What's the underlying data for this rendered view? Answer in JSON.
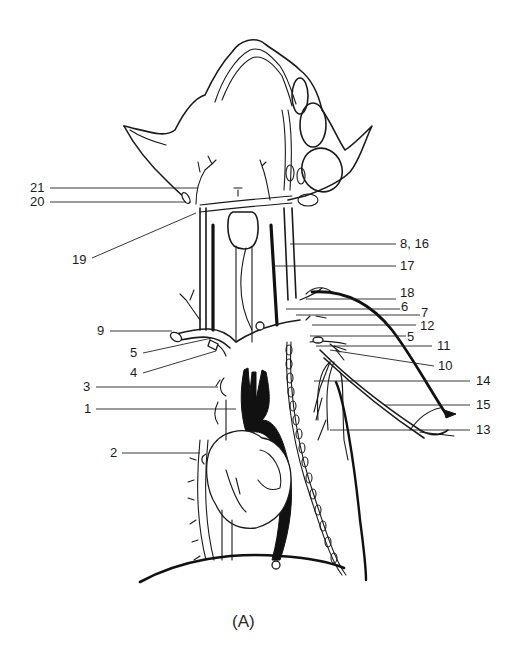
{
  "figure": {
    "caption": "(A)"
  },
  "labels": [
    {
      "id": "21",
      "text": "21",
      "side": "left"
    },
    {
      "id": "20",
      "text": "20",
      "side": "left"
    },
    {
      "id": "19",
      "text": "19",
      "side": "left"
    },
    {
      "id": "8_16",
      "text": "8, 16",
      "side": "right"
    },
    {
      "id": "17",
      "text": "17",
      "side": "right"
    },
    {
      "id": "18",
      "text": "18",
      "side": "right"
    },
    {
      "id": "6",
      "text": "6",
      "side": "right"
    },
    {
      "id": "7",
      "text": "7",
      "side": "right"
    },
    {
      "id": "12",
      "text": "12",
      "side": "right"
    },
    {
      "id": "5r",
      "text": "5",
      "side": "right"
    },
    {
      "id": "11",
      "text": "11",
      "side": "right"
    },
    {
      "id": "10",
      "text": "10",
      "side": "right"
    },
    {
      "id": "14",
      "text": "14",
      "side": "right"
    },
    {
      "id": "15",
      "text": "15",
      "side": "right"
    },
    {
      "id": "13",
      "text": "13",
      "side": "right"
    },
    {
      "id": "9",
      "text": "9",
      "side": "left"
    },
    {
      "id": "5l",
      "text": "5",
      "side": "left"
    },
    {
      "id": "4",
      "text": "4",
      "side": "left"
    },
    {
      "id": "3",
      "text": "3",
      "side": "left"
    },
    {
      "id": "1",
      "text": "1",
      "side": "left"
    },
    {
      "id": "2",
      "text": "2",
      "side": "left"
    }
  ]
}
